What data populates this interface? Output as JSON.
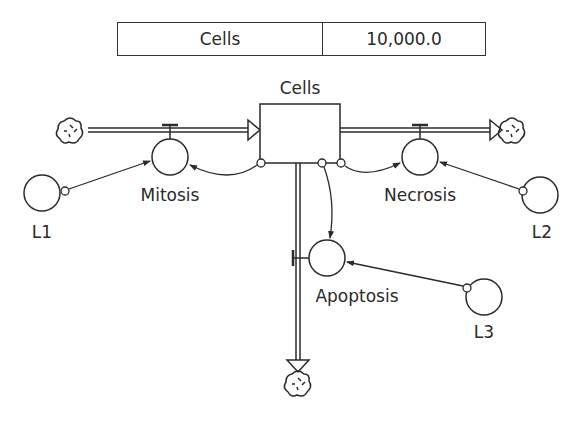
{
  "table": {
    "variable": "Cells",
    "value": "10,000.0"
  },
  "stock": {
    "label": "Cells"
  },
  "flows": [
    {
      "label": "Mitosis",
      "direction": "inflow"
    },
    {
      "label": "Necrosis",
      "direction": "outflow"
    },
    {
      "label": "Apoptosis",
      "direction": "outflow"
    }
  ],
  "converters": [
    {
      "label": "L1"
    },
    {
      "label": "L2"
    },
    {
      "label": "L3"
    }
  ],
  "colors": {
    "line": "#2a2a2a",
    "background": "#ffffff"
  }
}
